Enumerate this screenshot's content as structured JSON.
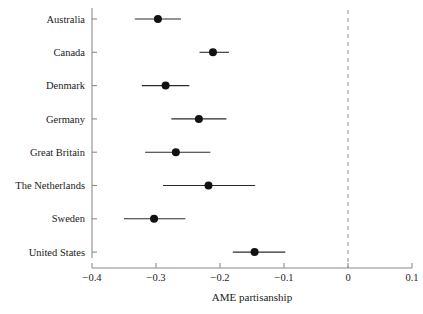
{
  "chart_data": {
    "type": "scatter",
    "title": "",
    "xlabel": "AME partisanship",
    "ylabel": "",
    "xlim": [
      -0.4,
      0.1
    ],
    "xticks": [
      -0.4,
      -0.3,
      -0.2,
      -0.1,
      0,
      0.1
    ],
    "xticklabels": [
      "-0.4",
      "-0.3",
      "-0.2",
      "-0.1",
      "0",
      "0.1"
    ],
    "grid": false,
    "legend": "none",
    "reference_line": {
      "x": 0,
      "style": "dashed",
      "color": "#9a9a9a"
    },
    "categories": [
      "Australia",
      "Canada",
      "Denmark",
      "Germany",
      "Great Britain",
      "The Netherlands",
      "Sweden",
      "United States"
    ],
    "values": [
      -0.297,
      -0.211,
      -0.285,
      -0.233,
      -0.269,
      -0.218,
      -0.303,
      -0.146
    ],
    "ci_low": [
      -0.333,
      -0.232,
      -0.322,
      -0.276,
      -0.317,
      -0.289,
      -0.35,
      -0.18
    ],
    "ci_high": [
      -0.261,
      -0.186,
      -0.248,
      -0.19,
      -0.215,
      -0.145,
      -0.254,
      -0.098
    ],
    "point_color": "#121212",
    "error_bar_color": "#2b2b2b"
  }
}
